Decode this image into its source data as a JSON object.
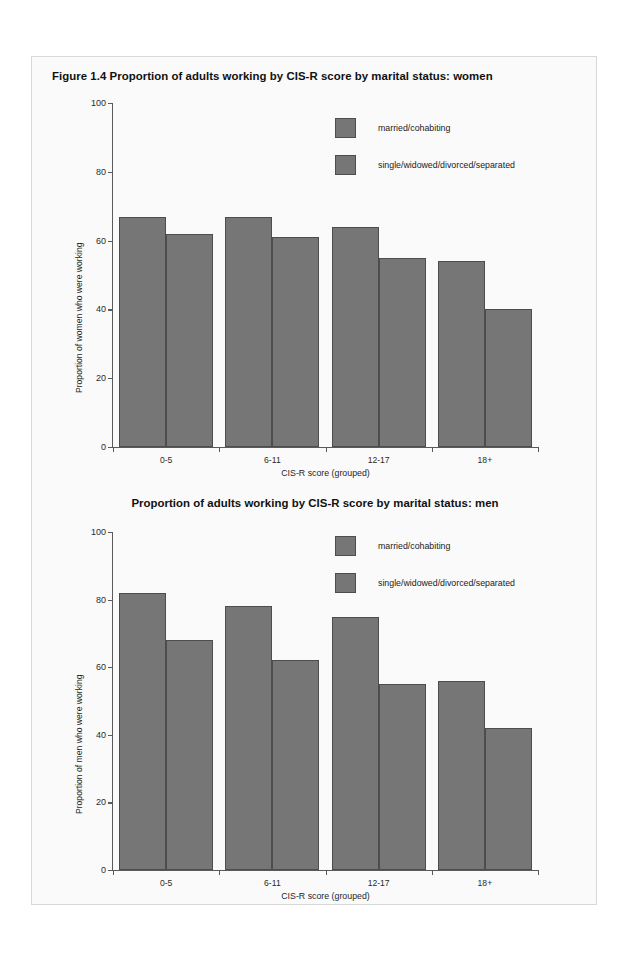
{
  "page": {
    "background": "#fafafa",
    "border_color": "#d8d8d8"
  },
  "figure": {
    "number": "Figure 1.4",
    "title_women": "Figure 1.4   Proportion of adults working by CIS-R score by marital status: women",
    "title_men": "Proportion of adults working by CIS-R score by marital status: men"
  },
  "colors": {
    "bar_fill": "#767676",
    "bar_stroke": "#4d4d4d",
    "axis": "#5a5a5a",
    "text": "#1a1a1a"
  },
  "chart_data": [
    {
      "type": "bar",
      "title": "Figure 1.4   Proportion of adults working by CIS-R score by marital status: women",
      "xlabel": "CIS-R score (grouped)",
      "ylabel": "Proportion of women who were working",
      "categories": [
        "0-5",
        "6-11",
        "12-17",
        "18+"
      ],
      "yticks": [
        "0",
        "20",
        "40",
        "60",
        "80",
        "100"
      ],
      "ylim": [
        0,
        100
      ],
      "grid": false,
      "legend_position": "top-right",
      "series": [
        {
          "name": "married/cohabiting",
          "values": [
            67,
            67,
            64,
            54
          ]
        },
        {
          "name": "single/widowed/divorced/separated",
          "values": [
            62,
            61,
            55,
            40
          ]
        }
      ]
    },
    {
      "type": "bar",
      "title": "Proportion of adults working by CIS-R score by marital status: men",
      "xlabel": "CIS-R score (grouped)",
      "ylabel": "Proportion of men who were working",
      "categories": [
        "0-5",
        "6-11",
        "12-17",
        "18+"
      ],
      "yticks": [
        "0",
        "20",
        "40",
        "60",
        "80",
        "100"
      ],
      "ylim": [
        0,
        100
      ],
      "grid": false,
      "legend_position": "top-right",
      "series": [
        {
          "name": "married/cohabiting",
          "values": [
            82,
            78,
            75,
            56
          ]
        },
        {
          "name": "single/widowed/divorced/separated",
          "values": [
            68,
            62,
            55,
            42
          ]
        }
      ]
    }
  ]
}
